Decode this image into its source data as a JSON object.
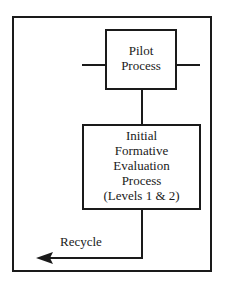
{
  "diagram": {
    "pilot_box": {
      "line1": "Pilot",
      "line2": "Process"
    },
    "initial_box": {
      "line1": "Initial",
      "line2": "Formative",
      "line3": "Evaluation",
      "line4": "Process",
      "line5": "(Levels 1 & 2)"
    },
    "recycle_label": "Recycle",
    "stroke_color": "#1a1a1a",
    "background": "#ffffff"
  }
}
